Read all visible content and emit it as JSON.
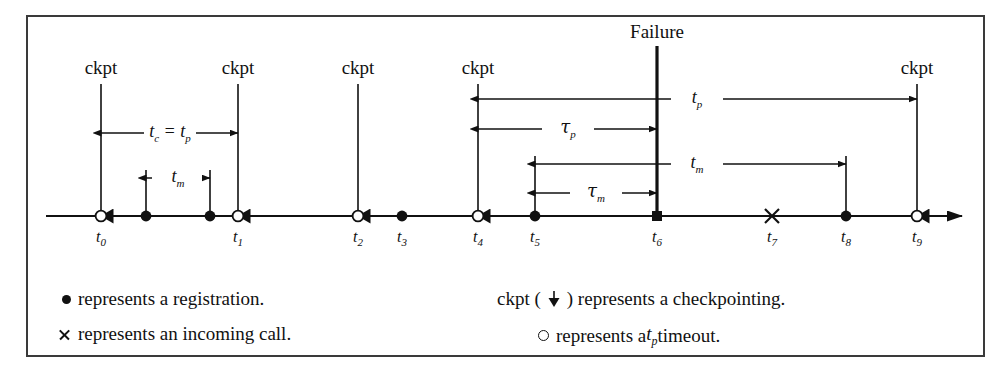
{
  "figure": {
    "type": "timeline-diagram",
    "background": "#ffffff",
    "ink_color": "#111111",
    "border_color": "#3a3a3a"
  },
  "axis": {
    "name": "time-axis",
    "y": 216,
    "x_start": 46,
    "x_end": 962,
    "has_end_arrow": true
  },
  "ticks": [
    {
      "id": "t0",
      "label": "t",
      "sub": "0",
      "x": 101,
      "marker": "open-circle",
      "has_ckpt": true
    },
    {
      "id": "t1",
      "label": "t",
      "sub": "1",
      "x": 238,
      "marker": "open-circle",
      "has_ckpt": true
    },
    {
      "id": "t2",
      "label": "t",
      "sub": "2",
      "x": 358,
      "marker": "open-circle",
      "has_ckpt": true
    },
    {
      "id": "t3",
      "label": "t",
      "sub": "3",
      "x": 402,
      "marker": "filled-dot",
      "has_ckpt": false
    },
    {
      "id": "t4",
      "label": "t",
      "sub": "4",
      "x": 478,
      "marker": "open-circle",
      "has_ckpt": true
    },
    {
      "id": "t5",
      "label": "t",
      "sub": "5",
      "x": 535,
      "marker": "filled-dot",
      "has_ckpt": false
    },
    {
      "id": "t6",
      "label": "t",
      "sub": "6",
      "x": 657,
      "marker": "filled-square",
      "has_ckpt": false
    },
    {
      "id": "t7",
      "label": "t",
      "sub": "7",
      "x": 772,
      "marker": "cross",
      "has_ckpt": false
    },
    {
      "id": "t8",
      "label": "t",
      "sub": "8",
      "x": 846,
      "marker": "filled-dot",
      "has_ckpt": false
    },
    {
      "id": "t9",
      "label": "t",
      "sub": "9",
      "x": 917,
      "marker": "open-circle",
      "has_ckpt": true
    }
  ],
  "registrations": [
    {
      "id": "r1",
      "x": 146
    },
    {
      "id": "r2",
      "x": 210
    }
  ],
  "ckpt_labels": [
    {
      "text": "ckpt",
      "x": 101
    },
    {
      "text": "ckpt",
      "x": 238
    },
    {
      "text": "ckpt",
      "x": 358
    },
    {
      "text": "ckpt",
      "x": 478
    },
    {
      "text": "ckpt",
      "x": 917
    }
  ],
  "failure": {
    "label": "Failure",
    "x": 657,
    "label_y": 22,
    "line_top": 46,
    "line_bottom": 216
  },
  "measures": [
    {
      "id": "tc-tp",
      "text_main": "t",
      "sub_main": "c",
      "text_eq": " = ",
      "text_second": "t",
      "sub_second": "p",
      "y": 133,
      "x_from": 101,
      "x_to": 238,
      "label_x": 170,
      "arrow_left": true,
      "arrow_right": true
    },
    {
      "id": "tm-left",
      "text_main": "t",
      "sub_main": "m",
      "y": 178,
      "x_from": 146,
      "x_to": 210,
      "label_x": 178,
      "arrow_left": true,
      "arrow_right": true
    },
    {
      "id": "tp-right",
      "text_main": "t",
      "sub_main": "p",
      "y": 99,
      "x_from": 478,
      "x_to": 917,
      "label_x": 697,
      "arrow_left": true,
      "arrow_right": true
    },
    {
      "id": "tau-p",
      "text_main": "τ",
      "sub_main": "p",
      "y": 129,
      "x_from": 478,
      "x_to": 657,
      "label_x": 568,
      "arrow_left": true,
      "arrow_right": true,
      "greek": true
    },
    {
      "id": "tm-right",
      "text_main": "t",
      "sub_main": "m",
      "y": 164,
      "x_from": 535,
      "x_to": 846,
      "label_x": 697,
      "arrow_left": true,
      "arrow_right": true
    },
    {
      "id": "tau-m",
      "text_main": "τ",
      "sub_main": "m",
      "y": 193,
      "x_from": 535,
      "x_to": 657,
      "label_x": 596,
      "arrow_left": true,
      "arrow_right": true,
      "greek": true
    }
  ],
  "verticals": [
    {
      "id": "v-t0",
      "x": 101,
      "y_top": 84,
      "y_bottom": 216,
      "ckpt_arrow": true
    },
    {
      "id": "v-t1",
      "x": 238,
      "y_top": 84,
      "y_bottom": 216,
      "ckpt_arrow": true
    },
    {
      "id": "v-t2",
      "x": 358,
      "y_top": 84,
      "y_bottom": 216,
      "ckpt_arrow": true
    },
    {
      "id": "v-t4",
      "x": 478,
      "y_top": 84,
      "y_bottom": 216,
      "ckpt_arrow": true
    },
    {
      "id": "v-t9",
      "x": 917,
      "y_top": 84,
      "y_bottom": 216,
      "ckpt_arrow": true
    },
    {
      "id": "v-r1",
      "x": 146,
      "y_top": 170,
      "y_bottom": 216,
      "ckpt_arrow": false
    },
    {
      "id": "v-r2",
      "x": 210,
      "y_top": 170,
      "y_bottom": 216,
      "ckpt_arrow": false
    },
    {
      "id": "v-t5",
      "x": 535,
      "y_top": 156,
      "y_bottom": 216,
      "ckpt_arrow": false
    },
    {
      "id": "v-t8",
      "x": 846,
      "y_top": 156,
      "y_bottom": 216,
      "ckpt_arrow": false
    }
  ],
  "legend": {
    "left": [
      {
        "glyph": "filled-dot",
        "text": "represents a registration.",
        "x": 62,
        "y": 288
      },
      {
        "glyph": "cross",
        "text": "represents an incoming call.",
        "x": 58,
        "y": 323
      }
    ],
    "right": [
      {
        "glyph": "ckpt-down-arrow",
        "prefix": "ckpt (",
        "suffix": ") represents a checkpointing.",
        "x": 497,
        "y": 288
      },
      {
        "glyph": "open-circle",
        "prefix": "",
        "text_before": "represents a ",
        "italic_main": "t",
        "italic_sub": "p",
        "text_after": " timeout.",
        "x": 538,
        "y": 323
      }
    ]
  }
}
